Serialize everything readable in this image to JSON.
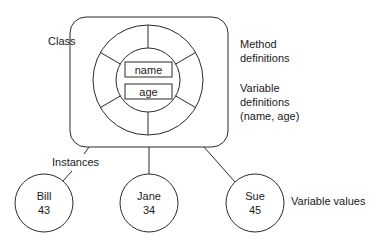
{
  "diagram": {
    "type": "object-class-instances",
    "class_label": "Class",
    "class_fields": {
      "field_1": "name",
      "field_2": "age"
    },
    "annotations": {
      "method_line1": "Method",
      "method_line2": "definitions",
      "variable_line1": "Variable",
      "variable_line2": "definitions",
      "variable_line3": "(name, age)",
      "instances": "Instances",
      "variable_values": "Variable values"
    },
    "instances": [
      {
        "name": "Bill",
        "value": "43"
      },
      {
        "name": "Jane",
        "value": "34"
      },
      {
        "name": "Sue",
        "value": "45"
      }
    ],
    "colors": {
      "stroke": "#2a2a2a",
      "text": "#1a1a1a",
      "background": "#ffffff"
    }
  }
}
